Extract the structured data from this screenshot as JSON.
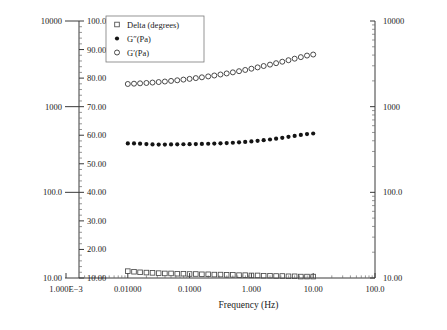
{
  "chart_data": {
    "type": "scatter",
    "title": "",
    "xlabel": "Frequency (Hz)",
    "ylabel": "",
    "xscale": "log",
    "xlim": [
      0.001,
      100
    ],
    "grid": false,
    "legend_position": "top-left",
    "x_tick_labels": [
      "1.000E−3",
      "0.01000",
      "0.1000",
      "1.000",
      "10.00",
      "100.0"
    ],
    "x_tick_values": [
      0.001,
      0.01,
      0.1,
      1,
      10,
      100
    ],
    "axes": [
      {
        "name": "left-outer-log-axis",
        "scale": "log",
        "lim": [
          10,
          10000
        ],
        "tick_labels": [
          "10000",
          "1000",
          "100.0",
          "10.00"
        ],
        "tick_values": [
          10000,
          1000,
          100,
          10
        ],
        "units": "Pa"
      },
      {
        "name": "left-inner-linear-axis",
        "scale": "linear",
        "lim": [
          10,
          100
        ],
        "tick_labels": [
          "100.0",
          "90.00",
          "80.00",
          "70.00",
          "60.00",
          "50.00",
          "40.00",
          "30.00",
          "20.00",
          "10.00"
        ],
        "tick_values": [
          100,
          90,
          80,
          70,
          60,
          50,
          40,
          30,
          20,
          10
        ],
        "units": "degrees"
      },
      {
        "name": "right-log-axis",
        "scale": "log",
        "lim": [
          10,
          10000
        ],
        "tick_labels": [
          "10000",
          "1000",
          "100.0",
          "10.00"
        ],
        "tick_values": [
          10000,
          1000,
          100,
          10
        ],
        "units": "Pa"
      }
    ],
    "series": [
      {
        "name": "Delta (degrees)",
        "marker": "open-square",
        "axis": "left-inner-linear-axis",
        "x": [
          0.01,
          0.0126,
          0.0158,
          0.02,
          0.0251,
          0.0316,
          0.0398,
          0.0501,
          0.0631,
          0.0794,
          0.1,
          0.126,
          0.158,
          0.2,
          0.251,
          0.316,
          0.398,
          0.501,
          0.631,
          0.794,
          1.0,
          1.26,
          1.58,
          2.0,
          2.51,
          3.16,
          3.98,
          5.01,
          6.31,
          7.94,
          10.0
        ],
        "y": [
          12.4,
          12.2,
          12.0,
          11.9,
          11.8,
          11.7,
          11.6,
          11.6,
          11.5,
          11.5,
          11.4,
          11.4,
          11.3,
          11.3,
          11.2,
          11.2,
          11.1,
          11.1,
          11.0,
          11.0,
          10.9,
          10.9,
          10.8,
          10.8,
          10.7,
          10.7,
          10.6,
          10.6,
          10.5,
          10.5,
          10.5
        ]
      },
      {
        "name": "G″ (Pa)",
        "marker": "filled-circle",
        "axis": "left-outer-log-axis",
        "x": [
          0.01,
          0.0126,
          0.0158,
          0.02,
          0.0251,
          0.0316,
          0.0398,
          0.0501,
          0.0631,
          0.0794,
          0.1,
          0.126,
          0.158,
          0.2,
          0.251,
          0.316,
          0.398,
          0.501,
          0.631,
          0.794,
          1.0,
          1.26,
          1.58,
          2.0,
          2.51,
          3.16,
          3.98,
          5.01,
          6.31,
          7.94,
          10.0
        ],
        "y": [
          372,
          372,
          370,
          366,
          362,
          361,
          361,
          362,
          363,
          364,
          365,
          366,
          367,
          369,
          371,
          373,
          376,
          379,
          383,
          388,
          393,
          399,
          406,
          414,
          423,
          433,
          444,
          456,
          468,
          479,
          486
        ]
      },
      {
        "name": "G′ (Pa)",
        "marker": "open-circle",
        "axis": "left-outer-log-axis",
        "x": [
          0.01,
          0.0126,
          0.0158,
          0.02,
          0.0251,
          0.0316,
          0.0398,
          0.0501,
          0.0631,
          0.0794,
          0.1,
          0.126,
          0.158,
          0.2,
          0.251,
          0.316,
          0.398,
          0.501,
          0.631,
          0.794,
          1.0,
          1.26,
          1.58,
          2.0,
          2.51,
          3.16,
          3.98,
          5.01,
          6.31,
          7.94,
          10.0
        ],
        "y": [
          1840,
          1855,
          1872,
          1890,
          1912,
          1938,
          1966,
          1998,
          2032,
          2070,
          2110,
          2155,
          2202,
          2255,
          2312,
          2375,
          2442,
          2515,
          2595,
          2682,
          2775,
          2875,
          2982,
          3096,
          3218,
          3348,
          3486,
          3632,
          3786,
          3948,
          4060
        ]
      }
    ],
    "legend_entries": [
      {
        "label": "Delta (degrees)",
        "marker": "open-square"
      },
      {
        "label": "G″(Pa)",
        "marker": "filled-circle"
      },
      {
        "label": "G′(Pa)",
        "marker": "open-circle"
      }
    ]
  }
}
